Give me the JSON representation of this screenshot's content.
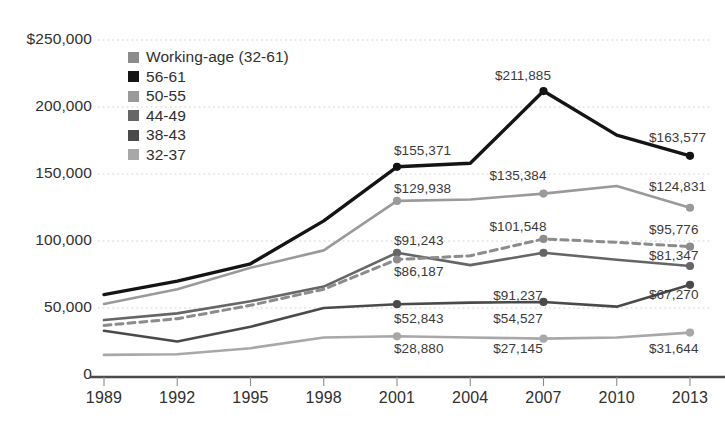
{
  "chart_data": {
    "type": "line",
    "title": "",
    "xlabel": "",
    "ylabel": "",
    "x": [
      1989,
      1992,
      1995,
      1998,
      2001,
      2004,
      2007,
      2010,
      2013
    ],
    "categories": [
      "1989",
      "1992",
      "1995",
      "1998",
      "2001",
      "2004",
      "2007",
      "2010",
      "2013"
    ],
    "ylim": [
      0,
      250000
    ],
    "ytick_labels": [
      "$250,000",
      "200,000",
      "150,000",
      "100,000",
      "50,000",
      "0"
    ],
    "ytick_values": [
      250000,
      200000,
      150000,
      100000,
      50000,
      0
    ],
    "grid": "horizontal-dotted",
    "legend_position": "upper-left-inside",
    "series": [
      {
        "name": "Working-age (32-61)",
        "color": "#8c8c8c",
        "style": "dashed",
        "values": [
          37000,
          42000,
          52000,
          64000,
          86187,
          89000,
          101548,
          99000,
          95776
        ],
        "labels": {
          "2001": "$86,187",
          "2007": "$101,548",
          "2013": "$95,776"
        }
      },
      {
        "name": "56-61",
        "color": "#141414",
        "style": "solid",
        "values": [
          60000,
          70000,
          83000,
          115000,
          155371,
          158000,
          211885,
          179000,
          163577
        ],
        "labels": {
          "2001": "$155,371",
          "2007": "$211,885",
          "2013": "$163,577"
        }
      },
      {
        "name": "50-55",
        "color": "#9a9a9a",
        "style": "solid",
        "values": [
          53000,
          64000,
          80000,
          93000,
          129938,
          131000,
          135384,
          141000,
          124831
        ],
        "labels": {
          "2001": "$129,938",
          "2007": "$135,384",
          "2013": "$124,831"
        }
      },
      {
        "name": "44-49",
        "color": "#666666",
        "style": "solid",
        "values": [
          41000,
          46000,
          55000,
          66000,
          91243,
          82000,
          91237,
          86000,
          81347
        ],
        "labels": {
          "2001": "$91,243",
          "2007": "$91,237",
          "2013": "$81,347"
        }
      },
      {
        "name": "38-43",
        "color": "#4a4a4a",
        "style": "solid",
        "values": [
          33000,
          25000,
          36000,
          50000,
          52843,
          54000,
          54527,
          51000,
          67270
        ],
        "labels": {
          "2001": "$52,843",
          "2007": "$54,527",
          "2013": "$67,270"
        }
      },
      {
        "name": "32-37",
        "color": "#a8a8a8",
        "style": "solid",
        "values": [
          15000,
          15500,
          20000,
          28000,
          28880,
          28000,
          27145,
          28000,
          31644
        ],
        "labels": {
          "2001": "$28,880",
          "2007": "$27,145",
          "2013": "$31,644"
        }
      }
    ],
    "data_labels": [
      {
        "text": "$211,885",
        "series": "56-61",
        "x": 523,
        "y": 68,
        "align": "center"
      },
      {
        "text": "$155,371",
        "series": "56-61",
        "x": 394,
        "y": 143,
        "align": "left"
      },
      {
        "text": "$163,577",
        "series": "56-61",
        "x": 649,
        "y": 130,
        "align": "left"
      },
      {
        "text": "$135,384",
        "series": "50-55",
        "x": 518,
        "y": 168,
        "align": "center"
      },
      {
        "text": "$129,938",
        "series": "50-55",
        "x": 394,
        "y": 181,
        "align": "left"
      },
      {
        "text": "$124,831",
        "series": "50-55",
        "x": 649,
        "y": 179,
        "align": "left"
      },
      {
        "text": "$101,548",
        "series": "Working-age (32-61)",
        "x": 518,
        "y": 219,
        "align": "center"
      },
      {
        "text": "$86,187",
        "series": "Working-age (32-61)",
        "x": 394,
        "y": 264,
        "align": "left"
      },
      {
        "text": "$95,776",
        "series": "Working-age (32-61)",
        "x": 649,
        "y": 222,
        "align": "left"
      },
      {
        "text": "$91,243",
        "series": "44-49",
        "x": 394,
        "y": 233,
        "align": "left"
      },
      {
        "text": "$91,237",
        "series": "44-49",
        "x": 518,
        "y": 288,
        "align": "center"
      },
      {
        "text": "$81,347",
        "series": "44-49",
        "x": 649,
        "y": 248,
        "align": "left"
      },
      {
        "text": "$52,843",
        "series": "38-43",
        "x": 394,
        "y": 311,
        "align": "left"
      },
      {
        "text": "$54,527",
        "series": "38-43",
        "x": 518,
        "y": 311,
        "align": "center"
      },
      {
        "text": "$67,270",
        "series": "38-43",
        "x": 649,
        "y": 287,
        "align": "left"
      },
      {
        "text": "$28,880",
        "series": "32-37",
        "x": 394,
        "y": 341,
        "align": "left"
      },
      {
        "text": "$27,145",
        "series": "32-37",
        "x": 518,
        "y": 341,
        "align": "center"
      },
      {
        "text": "$31,644",
        "series": "32-37",
        "x": 649,
        "y": 341,
        "align": "left"
      }
    ]
  },
  "legend": {
    "items": [
      {
        "label": "Working-age (32-61)",
        "color": "#8c8c8c"
      },
      {
        "label": "56-61",
        "color": "#141414"
      },
      {
        "label": "50-55",
        "color": "#9a9a9a"
      },
      {
        "label": "44-49",
        "color": "#666666"
      },
      {
        "label": "38-43",
        "color": "#4a4a4a"
      },
      {
        "label": "32-37",
        "color": "#a8a8a8"
      }
    ]
  },
  "colors": {
    "background": "#ffffff",
    "axis": "#4a4a4a",
    "gridline": "#cfcfcf",
    "text": "#2f2f2f"
  }
}
